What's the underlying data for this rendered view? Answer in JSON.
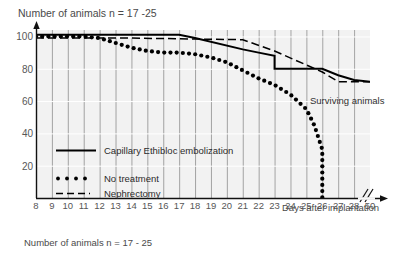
{
  "chart_data": {
    "type": "line",
    "title": "Number of animals  n = 17 -25",
    "caption": "Number of animals  n = 17 - 25",
    "xlabel": "Days after implantation",
    "ylabel": "",
    "annotation": "Surviving animals",
    "xlim": [
      8,
      29
    ],
    "ylim": [
      0,
      104
    ],
    "grid": true,
    "axis_break": {
      "after": 28,
      "final_tick": 50,
      "marker": "//"
    },
    "xticks": [
      8,
      9,
      10,
      11,
      12,
      13,
      14,
      15,
      16,
      17,
      18,
      19,
      20,
      21,
      22,
      23,
      24,
      25,
      26,
      27,
      28,
      50
    ],
    "yticks": [
      20,
      40,
      60,
      80,
      100
    ],
    "legend_position": "inside-lower-left",
    "series": [
      {
        "name": "Capillary Ethibloc embolization",
        "style": "solid",
        "color": "#000000",
        "x": [
          8,
          17,
          18,
          21,
          22,
          23,
          23,
          25,
          26,
          27,
          28,
          50
        ],
        "values": [
          101,
          101,
          99,
          92,
          90,
          88,
          80,
          80,
          80,
          76,
          73,
          72
        ]
      },
      {
        "name": "No treatment",
        "style": "dotted",
        "color": "#000000",
        "x": [
          8,
          9,
          10,
          11,
          12,
          13,
          14,
          15,
          16,
          17,
          18,
          19,
          20,
          21,
          22,
          23,
          24,
          25,
          25.5,
          26,
          26,
          26
        ],
        "values": [
          100,
          100,
          100,
          100,
          99,
          96,
          93,
          91,
          90,
          90,
          89,
          87,
          84,
          79,
          74,
          70,
          64,
          55,
          45,
          30,
          20,
          0
        ]
      },
      {
        "name": "Nephrectomy",
        "style": "dashed",
        "color": "#000000",
        "x": [
          8,
          14,
          21,
          23,
          26,
          27,
          28,
          50
        ],
        "values": [
          99,
          99,
          98,
          91,
          78,
          72,
          72,
          72
        ]
      }
    ]
  },
  "legend": {
    "items": [
      {
        "key": "solid-line-key",
        "label": "Capillary Ethibloc embolization"
      },
      {
        "key": "dotted-line-key",
        "label": "No treatment"
      },
      {
        "key": "dashed-line-key",
        "label": "Nephrectomy"
      }
    ]
  },
  "axis": {
    "x_caption": "Days after implantation",
    "y_tick_labels": [
      "100",
      "80",
      "60",
      "40",
      "20"
    ],
    "x_tick_labels": [
      "8",
      "9",
      "10",
      "11",
      "12",
      "13",
      "14",
      "15",
      "16",
      "17",
      "18",
      "19",
      "20",
      "21",
      "22",
      "23",
      "24",
      "25",
      "26",
      "27",
      "28",
      "50"
    ]
  },
  "annotations": {
    "surviving_animals": "Surviving animals"
  }
}
